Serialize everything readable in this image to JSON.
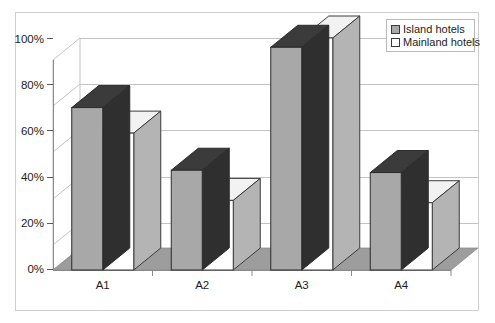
{
  "chart_data": {
    "type": "bar",
    "title": "",
    "subtitle": "",
    "xlabel": "",
    "ylabel": "",
    "categories": [
      "A1",
      "A2",
      "A3",
      "A4"
    ],
    "series": [
      {
        "name": "Island hotels",
        "color": "#a8a8a8",
        "values": [
          70,
          43,
          96,
          42
        ]
      },
      {
        "name": "Mainland hotels",
        "color": "#ffffff",
        "values": [
          59,
          30,
          100,
          29
        ]
      }
    ],
    "ylim": [
      0,
      100
    ],
    "yticks": [
      0,
      20,
      40,
      60,
      80,
      100
    ],
    "ytick_labels": [
      "0%",
      "20%",
      "40%",
      "60%",
      "80%",
      "100%"
    ],
    "grid": true,
    "grid_axis": "y",
    "legend_position": "top-right",
    "three_d": true,
    "annotations": []
  },
  "legend": {
    "entries": [
      {
        "label": "Island hotels",
        "swatch": "gray"
      },
      {
        "label": "Mainland hotels",
        "swatch": "white"
      }
    ]
  },
  "colors": {
    "bar_gray_front": "#a8a8a8",
    "bar_gray_top": "#3b3b3b",
    "bar_gray_side": "#2f2f2f",
    "bar_white_front": "#ffffff",
    "bar_white_top": "#f2f2f2",
    "bar_white_side": "#b4b4b4",
    "floor": "#9d9d9d",
    "grid_line": "#b9b9b9",
    "axis_line": "#8a8a8a",
    "outer_border": "#cfcfcf",
    "text": "#1c1c1c",
    "background": "#ffffff"
  }
}
